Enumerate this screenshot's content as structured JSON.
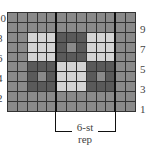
{
  "chart_data": {
    "type": "table",
    "columns": 13,
    "rows": 10,
    "legend": {
      "M": "medium gray",
      "L": "light gray",
      "D": "dark gray"
    },
    "colors": {
      "M": "#8a8a8a",
      "L": "#d4d4d4",
      "D": "#5a5a5a",
      "grid": "#333333"
    },
    "grid_top_to_bottom": [
      "MMMMMMMMMMMMM",
      "MMMMMMMMMMMMM",
      "MMLLLDDDLLLMM",
      "MMLLLDMDLLLMM",
      "MMLLLDDDLLLMM",
      "MMDDDLLLDDDMM",
      "MMDMDLLLDMDMM",
      "MMDDDLLLDDDMM",
      "MMMMMMMMMMMMM",
      "MMMMMMMMMMMMM"
    ],
    "left_row_labels": [
      "10",
      "8",
      "6",
      "4",
      "2"
    ],
    "right_row_labels": [
      "9",
      "7",
      "5",
      "3",
      "1"
    ],
    "repeat": {
      "start_col": 6,
      "end_col": 11,
      "label_line1": "6-st",
      "label_line2": "rep"
    }
  }
}
